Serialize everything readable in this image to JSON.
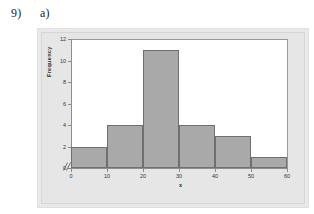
{
  "header": {
    "question_number": "9)",
    "question_part": "a)"
  },
  "chart_data": {
    "type": "bar",
    "title": "",
    "xlabel": "x",
    "ylabel": "Frequency",
    "categories": [
      "0-10",
      "10-20",
      "20-30",
      "30-40",
      "40-50",
      "50-60"
    ],
    "bin_edges": [
      0,
      10,
      20,
      30,
      40,
      50,
      60
    ],
    "values": [
      2,
      4,
      11,
      4,
      3,
      1
    ],
    "xlim": [
      0,
      60
    ],
    "ylim": [
      0,
      12
    ],
    "x_ticks": [
      "0",
      "10",
      "20",
      "30",
      "40",
      "50",
      "60"
    ],
    "x_tick_values": [
      0,
      10,
      20,
      30,
      40,
      50,
      60
    ],
    "y_ticks": [
      "0",
      "2",
      "4",
      "6",
      "8",
      "10",
      "12"
    ],
    "y_tick_values": [
      0,
      2,
      4,
      6,
      8,
      10,
      12
    ],
    "grid": false,
    "legend": false,
    "axis_break": "//",
    "bar_fill_color": "#a9a9a9",
    "bar_edge_color": "#6f6f6f",
    "panel_color": "#e9e9e9",
    "plot_background": "#ffffff"
  }
}
